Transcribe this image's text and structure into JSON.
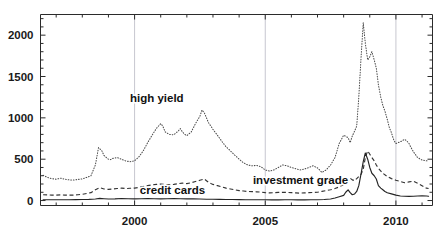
{
  "chart_data": {
    "type": "line",
    "title": "",
    "subtitle": "",
    "xlabel": "",
    "ylabel": "",
    "xlim": [
      1996.4,
      2011.4
    ],
    "ylim": [
      -60,
      2250
    ],
    "grid": "vertical gridlines at major x ticks",
    "legend_position": "inline annotations on curves",
    "x_ticks_major": [
      2000,
      2005,
      2010
    ],
    "x_tick_labels": [
      "2000",
      "2005",
      "2010"
    ],
    "x_ticks_minor": [
      1997,
      1998,
      1999,
      2001,
      2002,
      2003,
      2004,
      2006,
      2007,
      2008,
      2009,
      2011
    ],
    "y_ticks_major": [
      0,
      500,
      1000,
      1500,
      2000
    ],
    "y_tick_labels": [
      "0",
      "500",
      "1000",
      "1500",
      "2000"
    ],
    "y_ticks_minor": [
      100,
      200,
      300,
      400,
      600,
      700,
      800,
      900,
      1100,
      1200,
      1300,
      1400,
      1600,
      1700,
      1800,
      1900,
      2100,
      2200
    ],
    "annotations": [
      {
        "id": "high-yield",
        "text": "high yield",
        "x": 2000.85,
        "y": 1195
      },
      {
        "id": "investment-grade",
        "text": "investment grade",
        "x": 2006.35,
        "y": 195
      },
      {
        "id": "credit-cards",
        "text": "credit cards",
        "x": 2001.45,
        "y": 75
      }
    ],
    "colors": {
      "axis": "#2b2b2b",
      "grid": "#b9b9c4",
      "high_yield": "#4a4a4a",
      "investment_grade": "#333333",
      "credit_cards": "#242424",
      "background": "#ffffff"
    },
    "series": [
      {
        "name": "high yield",
        "style": "dotted",
        "x": [
          1996.5,
          1996.67,
          1996.83,
          1997.0,
          1997.17,
          1997.33,
          1997.5,
          1997.67,
          1997.83,
          1998.0,
          1998.17,
          1998.33,
          1998.5,
          1998.62,
          1998.75,
          1998.83,
          1998.92,
          1999.0,
          1999.08,
          1999.17,
          1999.33,
          1999.5,
          1999.67,
          1999.83,
          2000.0,
          2000.17,
          2000.33,
          2000.5,
          2000.67,
          2000.83,
          2001.0,
          2001.08,
          2001.17,
          2001.33,
          2001.5,
          2001.67,
          2001.75,
          2001.83,
          2001.92,
          2002.0,
          2002.17,
          2002.33,
          2002.5,
          2002.58,
          2002.67,
          2002.75,
          2002.83,
          2002.92,
          2003.0,
          2003.17,
          2003.33,
          2003.5,
          2003.67,
          2003.83,
          2004.0,
          2004.17,
          2004.33,
          2004.5,
          2004.67,
          2004.83,
          2005.0,
          2005.17,
          2005.33,
          2005.5,
          2005.67,
          2005.83,
          2006.0,
          2006.17,
          2006.33,
          2006.5,
          2006.67,
          2006.83,
          2007.0,
          2007.17,
          2007.33,
          2007.5,
          2007.67,
          2007.83,
          2008.0,
          2008.17,
          2008.25,
          2008.33,
          2008.42,
          2008.5,
          2008.58,
          2008.67,
          2008.75,
          2008.83,
          2008.92,
          2009.0,
          2009.08,
          2009.17,
          2009.25,
          2009.33,
          2009.42,
          2009.5,
          2009.58,
          2009.67,
          2009.75,
          2009.83,
          2009.92,
          2010.0,
          2010.17,
          2010.33,
          2010.42,
          2010.5,
          2010.58,
          2010.67,
          2010.83,
          2011.0,
          2011.17,
          2011.25
        ],
        "y": [
          305,
          280,
          265,
          258,
          270,
          258,
          250,
          248,
          255,
          262,
          280,
          300,
          430,
          640,
          600,
          545,
          520,
          500,
          495,
          510,
          520,
          500,
          478,
          470,
          480,
          530,
          600,
          700,
          790,
          870,
          930,
          900,
          830,
          800,
          795,
          840,
          870,
          830,
          800,
          785,
          830,
          930,
          1020,
          1095,
          1060,
          1000,
          940,
          900,
          860,
          790,
          720,
          650,
          600,
          550,
          500,
          455,
          430,
          420,
          425,
          410,
          370,
          355,
          370,
          400,
          430,
          420,
          400,
          385,
          370,
          380,
          400,
          420,
          395,
          340,
          370,
          430,
          520,
          690,
          790,
          760,
          700,
          780,
          840,
          900,
          1250,
          1750,
          2150,
          1900,
          1700,
          1740,
          1800,
          1700,
          1600,
          1400,
          1250,
          1150,
          1080,
          980,
          880,
          820,
          730,
          690,
          710,
          740,
          720,
          690,
          640,
          590,
          520,
          490,
          480,
          485
        ]
      },
      {
        "name": "investment grade",
        "style": "dashed",
        "x": [
          1996.5,
          1996.67,
          1996.83,
          1997.0,
          1997.17,
          1997.33,
          1997.5,
          1997.67,
          1997.83,
          1998.0,
          1998.17,
          1998.33,
          1998.5,
          1998.67,
          1998.83,
          1999.0,
          1999.17,
          1999.33,
          1999.5,
          1999.67,
          1999.83,
          2000.0,
          2000.17,
          2000.33,
          2000.5,
          2000.67,
          2000.83,
          2001.0,
          2001.17,
          2001.33,
          2001.5,
          2001.67,
          2001.83,
          2002.0,
          2002.17,
          2002.33,
          2002.5,
          2002.67,
          2002.75,
          2002.83,
          2002.92,
          2003.0,
          2003.17,
          2003.33,
          2003.5,
          2003.67,
          2003.83,
          2004.0,
          2004.17,
          2004.33,
          2004.5,
          2004.67,
          2004.83,
          2005.0,
          2005.17,
          2005.33,
          2005.5,
          2005.67,
          2005.83,
          2006.0,
          2006.17,
          2006.33,
          2006.5,
          2006.67,
          2006.83,
          2007.0,
          2007.17,
          2007.33,
          2007.5,
          2007.67,
          2007.83,
          2008.0,
          2008.17,
          2008.25,
          2008.33,
          2008.42,
          2008.5,
          2008.58,
          2008.67,
          2008.75,
          2008.83,
          2008.92,
          2009.0,
          2009.08,
          2009.17,
          2009.25,
          2009.33,
          2009.5,
          2009.67,
          2009.83,
          2010.0,
          2010.17,
          2010.33,
          2010.5,
          2010.67,
          2010.83,
          2011.0,
          2011.17,
          2011.25
        ],
        "y": [
          70,
          68,
          66,
          65,
          68,
          66,
          65,
          66,
          70,
          75,
          85,
          95,
          130,
          155,
          140,
          135,
          140,
          145,
          150,
          145,
          148,
          150,
          160,
          170,
          180,
          190,
          195,
          200,
          195,
          190,
          195,
          205,
          210,
          205,
          215,
          230,
          245,
          260,
          240,
          220,
          205,
          195,
          180,
          165,
          150,
          140,
          130,
          120,
          115,
          110,
          108,
          105,
          102,
          95,
          92,
          95,
          98,
          100,
          98,
          95,
          92,
          90,
          92,
          95,
          98,
          100,
          110,
          120,
          130,
          145,
          165,
          195,
          235,
          270,
          250,
          240,
          265,
          290,
          320,
          380,
          520,
          600,
          560,
          520,
          480,
          430,
          390,
          330,
          290,
          265,
          245,
          230,
          215,
          225,
          235,
          210,
          180,
          150,
          145
        ]
      },
      {
        "name": "credit cards",
        "style": "solid",
        "x": [
          1996.5,
          1996.75,
          1997.0,
          1997.25,
          1997.5,
          1997.75,
          1998.0,
          1998.25,
          1998.5,
          1998.67,
          1998.83,
          1999.0,
          1999.25,
          1999.5,
          1999.75,
          2000.0,
          2000.25,
          2000.5,
          2000.75,
          2001.0,
          2001.25,
          2001.5,
          2001.75,
          2002.0,
          2002.25,
          2002.5,
          2002.75,
          2003.0,
          2003.25,
          2003.5,
          2003.75,
          2004.0,
          2004.25,
          2004.5,
          2004.75,
          2005.0,
          2005.25,
          2005.5,
          2005.75,
          2006.0,
          2006.25,
          2006.5,
          2006.75,
          2007.0,
          2007.25,
          2007.5,
          2007.67,
          2007.83,
          2008.0,
          2008.08,
          2008.17,
          2008.25,
          2008.33,
          2008.42,
          2008.5,
          2008.58,
          2008.67,
          2008.75,
          2008.83,
          2008.92,
          2009.0,
          2009.08,
          2009.17,
          2009.25,
          2009.33,
          2009.42,
          2009.5,
          2009.58,
          2009.67,
          2009.83,
          2010.0,
          2010.17,
          2010.33,
          2010.5,
          2010.67,
          2010.83,
          2011.0,
          2011.17,
          2011.25
        ],
        "y": [
          10,
          9,
          9,
          10,
          10,
          11,
          12,
          14,
          18,
          26,
          22,
          18,
          20,
          24,
          22,
          20,
          22,
          24,
          22,
          20,
          22,
          24,
          22,
          20,
          20,
          18,
          16,
          15,
          14,
          13,
          12,
          11,
          10,
          10,
          9,
          9,
          8,
          8,
          9,
          9,
          8,
          8,
          9,
          10,
          12,
          18,
          30,
          45,
          62,
          100,
          130,
          95,
          70,
          80,
          110,
          180,
          330,
          470,
          575,
          500,
          400,
          330,
          300,
          260,
          180,
          150,
          130,
          110,
          95,
          80,
          65,
          55,
          52,
          50,
          52,
          55,
          58,
          55,
          52
        ]
      }
    ]
  }
}
